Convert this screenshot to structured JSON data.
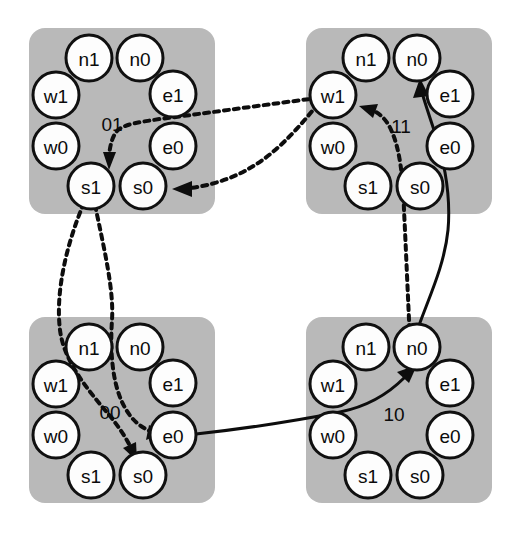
{
  "diagram": {
    "background_color": "#ffffff",
    "block_color": "#b9b9b9",
    "node_fill": "#fdfdfd",
    "node_stroke": "#101010",
    "edge_color": "#0d0d0d",
    "node_labels": {
      "n1": "n1",
      "n0": "n0",
      "e1": "e1",
      "e0": "e0",
      "s0": "s0",
      "s1": "s1",
      "w0": "w0",
      "w1": "w1"
    },
    "blocks": [
      {
        "id": "block-01",
        "label": "01",
        "position": "top-left",
        "nodes": [
          "n1",
          "n0",
          "e1",
          "e0",
          "s0",
          "s1",
          "w0",
          "w1"
        ]
      },
      {
        "id": "block-11",
        "label": "11",
        "position": "top-right",
        "nodes": [
          "n1",
          "n0",
          "e1",
          "e0",
          "s0",
          "s1",
          "w0",
          "w1"
        ]
      },
      {
        "id": "block-00",
        "label": "00",
        "position": "bottom-left",
        "nodes": [
          "n1",
          "n0",
          "e1",
          "e0",
          "s0",
          "s1",
          "w0",
          "w1"
        ]
      },
      {
        "id": "block-10",
        "label": "10",
        "position": "bottom-right",
        "nodes": [
          "n1",
          "n0",
          "e1",
          "e0",
          "s0",
          "s1",
          "w0",
          "w1"
        ]
      }
    ],
    "edges": [
      {
        "id": "edge-11w1-to-01s1",
        "style": "dashed",
        "from_block": "11",
        "from_node": "w1",
        "to_block": "01",
        "to_node": "s1"
      },
      {
        "id": "edge-11w1-to-01s0",
        "style": "dashed",
        "from_block": "11",
        "from_node": "w1",
        "to_block": "01",
        "to_node": "s0"
      },
      {
        "id": "edge-01s1-to-00s0",
        "style": "dashed",
        "from_block": "01",
        "from_node": "s1",
        "to_block": "00",
        "to_node": "s0"
      },
      {
        "id": "edge-01s1-to-00e0",
        "style": "dashed",
        "from_block": "01",
        "from_node": "s1",
        "to_block": "00",
        "to_node": "e0"
      },
      {
        "id": "edge-10n0-to-11w1",
        "style": "dashed",
        "from_block": "10",
        "from_node": "n0",
        "to_block": "11",
        "to_node": "w1"
      },
      {
        "id": "edge-10n0-to-11n0",
        "style": "solid",
        "from_block": "10",
        "from_node": "n0",
        "to_block": "11",
        "to_node": "n0"
      },
      {
        "id": "edge-00e0-to-10n0",
        "style": "solid",
        "from_block": "00",
        "from_node": "e0",
        "to_block": "10",
        "to_node": "n0"
      }
    ]
  }
}
